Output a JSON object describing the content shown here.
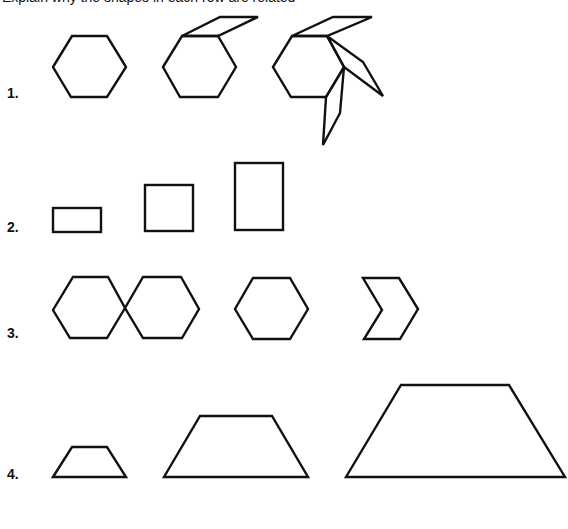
{
  "header": {
    "cut_off_text": "Explain why the shapes in each row are related"
  },
  "rows": [
    {
      "label": "1.",
      "description": "Hexagon, then hexagon with one attached rhombus, then hexagon with three attached rhombi",
      "figures": [
        "hexagon",
        "hexagon-with-1-rhombus",
        "hexagon-with-3-rhombi"
      ]
    },
    {
      "label": "2.",
      "description": "Three rectangles of equal width and increasing height",
      "figures": [
        "short-rectangle",
        "square",
        "tall-rectangle"
      ]
    },
    {
      "label": "3.",
      "description": "Two joined hexagons, a single hexagon, and a chevron (half-hexagon notch)",
      "figures": [
        "double-hexagon",
        "hexagon",
        "chevron"
      ]
    },
    {
      "label": "4.",
      "description": "Three trapezoids of increasing size",
      "figures": [
        "small-trapezoid",
        "medium-trapezoid",
        "large-trapezoid"
      ]
    }
  ],
  "colors": {
    "stroke": "#111111",
    "background": "#ffffff"
  }
}
